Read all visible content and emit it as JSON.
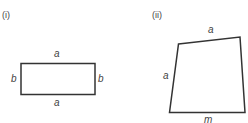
{
  "panels": [
    {
      "label": "(i)",
      "shape": "rectangle",
      "sides": {
        "top": "a",
        "bottom": "a",
        "left": "b",
        "right": "b"
      }
    },
    {
      "label": "(ii)",
      "shape": "quadrilateral",
      "sides": {
        "top": "a",
        "left": "a",
        "bottom": "m"
      }
    }
  ],
  "colors": {
    "stroke": "#333333",
    "text": "#444444"
  }
}
